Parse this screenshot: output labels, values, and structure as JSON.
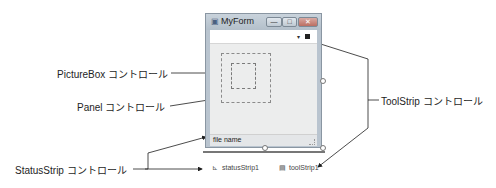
{
  "form": {
    "title": "MyForm",
    "title_icon": "form-icon",
    "buttons": {
      "minimize": "—",
      "maximize": "□",
      "close": "✕"
    },
    "toolstrip": {
      "dropdown_glyph": "▾",
      "item_icon": "square-icon"
    },
    "statusstrip": {
      "label": "file name"
    }
  },
  "tray": {
    "items": [
      {
        "icon": "⊾",
        "label": "statusStrip1"
      },
      {
        "icon": "▤",
        "label": "toolStrip1"
      }
    ]
  },
  "callouts": {
    "picturebox": "PictureBox コントロール",
    "panel": "Panel コントロール",
    "statusstrip": "StatusStrip コントロール",
    "toolstrip": "ToolStrip コントロール"
  }
}
